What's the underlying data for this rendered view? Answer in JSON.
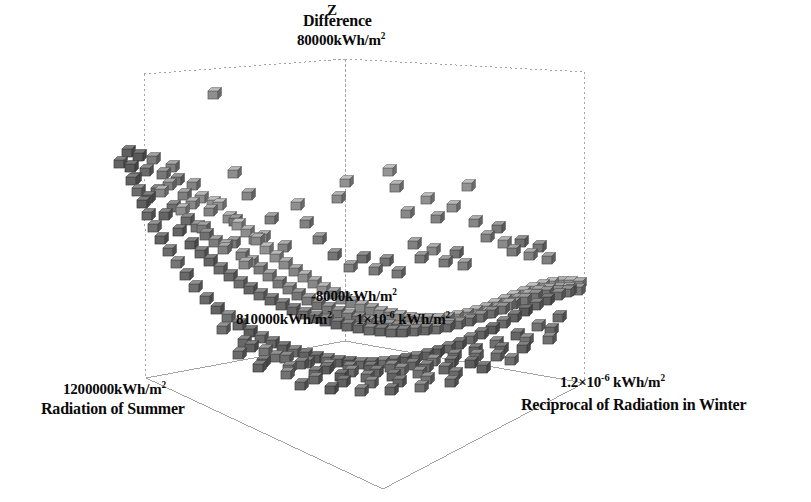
{
  "figure": {
    "type": "3d-scatter-plot",
    "background": "#ffffff",
    "frame_color": "#8a8a8a",
    "text_color": "#0a0a0a"
  },
  "labels": {
    "z_axis_letter": "Z",
    "z_title": "Difference",
    "z_max_tick": "80000kWh/m",
    "z_max_tick_exp": "2",
    "z_origin_tick": "-8000kWh/m",
    "z_origin_tick_exp": "2",
    "x_origin_tick": "810000kWh/m",
    "x_origin_tick_exp": "2",
    "y_origin_tick_prefix": "1×10",
    "y_origin_tick_exp": "-6",
    "y_origin_tick_suffix": " kWh/m",
    "y_origin_tick_unit_exp": "2",
    "x_max_tick": "1200000kWh/m",
    "x_max_tick_exp": "2",
    "x_axis_name": "Radiation of Summer",
    "y_max_tick_prefix": "1.2×10",
    "y_max_tick_exp": "-6",
    "y_max_tick_suffix": " kWh/m",
    "y_max_tick_unit_exp": "2",
    "y_axis_name": "Reciprocal of Radiation in Winter"
  },
  "chart_data": {
    "type": "scatter",
    "title": "Difference",
    "xlabel": "Radiation of Summer",
    "ylabel": "Reciprocal of Radiation in Winter",
    "zlabel": "Difference",
    "xlim": [
      "810000kWh/m2",
      "1200000kWh/m2"
    ],
    "ylim": [
      "1×10-6 kWh/m2",
      "1.2×10-6 kWh/m2"
    ],
    "zlim": [
      "-8000kWh/m2",
      "80000kWh/m2"
    ],
    "grid": false,
    "legend": false,
    "marker": "cube",
    "marker_size_px": 10,
    "marker_colors": [
      "#4a4a4a",
      "#5e5e5e",
      "#707070",
      "#858585",
      "#9a9a9a",
      "#aeaeae",
      "#bcbcbc"
    ],
    "points_px": [
      [
        213,
        95,
        0.72
      ],
      [
        127,
        153,
        0.3
      ],
      [
        138,
        157,
        0.26
      ],
      [
        119,
        164,
        0.34
      ],
      [
        152,
        160,
        0.55
      ],
      [
        145,
        172,
        0.4
      ],
      [
        162,
        175,
        0.52
      ],
      [
        131,
        181,
        0.33
      ],
      [
        168,
        186,
        0.62
      ],
      [
        176,
        181,
        0.48
      ],
      [
        156,
        192,
        0.38
      ],
      [
        183,
        196,
        0.58
      ],
      [
        147,
        199,
        0.3
      ],
      [
        191,
        205,
        0.66
      ],
      [
        200,
        199,
        0.7
      ],
      [
        172,
        208,
        0.44
      ],
      [
        164,
        216,
        0.36
      ],
      [
        209,
        212,
        0.62
      ],
      [
        218,
        206,
        0.74
      ],
      [
        186,
        221,
        0.41
      ],
      [
        196,
        228,
        0.5
      ],
      [
        178,
        232,
        0.35
      ],
      [
        228,
        219,
        0.68
      ],
      [
        237,
        226,
        0.76
      ],
      [
        205,
        236,
        0.46
      ],
      [
        214,
        243,
        0.56
      ],
      [
        190,
        245,
        0.33
      ],
      [
        246,
        233,
        0.7
      ],
      [
        223,
        250,
        0.6
      ],
      [
        232,
        244,
        0.52
      ],
      [
        200,
        254,
        0.38
      ],
      [
        256,
        241,
        0.66
      ],
      [
        241,
        256,
        0.58
      ],
      [
        209,
        262,
        0.35
      ],
      [
        265,
        250,
        0.74
      ],
      [
        250,
        263,
        0.62
      ],
      [
        219,
        270,
        0.42
      ],
      [
        275,
        258,
        0.71
      ],
      [
        259,
        270,
        0.55
      ],
      [
        229,
        277,
        0.39
      ],
      [
        284,
        265,
        0.68
      ],
      [
        268,
        277,
        0.6
      ],
      [
        239,
        284,
        0.44
      ],
      [
        294,
        272,
        0.63
      ],
      [
        278,
        284,
        0.52
      ],
      [
        249,
        290,
        0.36
      ],
      [
        303,
        278,
        0.7
      ],
      [
        288,
        290,
        0.57
      ],
      [
        259,
        296,
        0.43
      ],
      [
        313,
        284,
        0.65
      ],
      [
        297,
        296,
        0.5
      ],
      [
        270,
        301,
        0.38
      ],
      [
        322,
        290,
        0.72
      ],
      [
        307,
        301,
        0.55
      ],
      [
        281,
        306,
        0.41
      ],
      [
        332,
        295,
        0.6
      ],
      [
        317,
        306,
        0.48
      ],
      [
        292,
        311,
        0.36
      ],
      [
        341,
        300,
        0.68
      ],
      [
        327,
        310,
        0.52
      ],
      [
        303,
        315,
        0.44
      ],
      [
        351,
        304,
        0.62
      ],
      [
        337,
        314,
        0.5
      ],
      [
        314,
        319,
        0.38
      ],
      [
        360,
        308,
        0.66
      ],
      [
        347,
        317,
        0.55
      ],
      [
        325,
        322,
        0.42
      ],
      [
        370,
        311,
        0.58
      ],
      [
        357,
        320,
        0.46
      ],
      [
        336,
        325,
        0.35
      ],
      [
        379,
        314,
        0.64
      ],
      [
        367,
        323,
        0.52
      ],
      [
        347,
        327,
        0.4
      ],
      [
        389,
        316,
        0.6
      ],
      [
        377,
        325,
        0.48
      ],
      [
        358,
        329,
        0.37
      ],
      [
        398,
        318,
        0.66
      ],
      [
        387,
        327,
        0.54
      ],
      [
        369,
        331,
        0.43
      ],
      [
        408,
        320,
        0.58
      ],
      [
        397,
        328,
        0.46
      ],
      [
        380,
        332,
        0.35
      ],
      [
        417,
        321,
        0.63
      ],
      [
        407,
        329,
        0.5
      ],
      [
        391,
        333,
        0.4
      ],
      [
        427,
        321,
        0.57
      ],
      [
        417,
        329,
        0.47
      ],
      [
        402,
        333,
        0.36
      ],
      [
        436,
        321,
        0.65
      ],
      [
        427,
        329,
        0.52
      ],
      [
        413,
        332,
        0.42
      ],
      [
        446,
        320,
        0.6
      ],
      [
        437,
        328,
        0.48
      ],
      [
        424,
        331,
        0.37
      ],
      [
        455,
        318,
        0.68
      ],
      [
        447,
        326,
        0.55
      ],
      [
        435,
        330,
        0.44
      ],
      [
        465,
        316,
        0.62
      ],
      [
        457,
        324,
        0.5
      ],
      [
        446,
        328,
        0.38
      ],
      [
        474,
        313,
        0.7
      ],
      [
        467,
        321,
        0.56
      ],
      [
        457,
        325,
        0.45
      ],
      [
        484,
        310,
        0.64
      ],
      [
        477,
        318,
        0.52
      ],
      [
        468,
        322,
        0.4
      ],
      [
        493,
        306,
        0.72
      ],
      [
        487,
        314,
        0.58
      ],
      [
        479,
        318,
        0.46
      ],
      [
        503,
        302,
        0.66
      ],
      [
        497,
        310,
        0.54
      ],
      [
        490,
        314,
        0.42
      ],
      [
        512,
        298,
        0.74
      ],
      [
        507,
        306,
        0.6
      ],
      [
        501,
        310,
        0.48
      ],
      [
        522,
        294,
        0.68
      ],
      [
        517,
        301,
        0.56
      ],
      [
        512,
        305,
        0.44
      ],
      [
        531,
        290,
        0.76
      ],
      [
        527,
        297,
        0.62
      ],
      [
        523,
        301,
        0.5
      ],
      [
        541,
        287,
        0.7
      ],
      [
        537,
        293,
        0.58
      ],
      [
        534,
        297,
        0.46
      ],
      [
        550,
        285,
        0.72
      ],
      [
        547,
        291,
        0.6
      ],
      [
        545,
        294,
        0.48
      ],
      [
        560,
        284,
        0.66
      ],
      [
        557,
        290,
        0.54
      ],
      [
        556,
        293,
        0.42
      ],
      [
        569,
        284,
        0.7
      ],
      [
        567,
        290,
        0.58
      ],
      [
        566,
        293,
        0.46
      ],
      [
        578,
        285,
        0.64
      ],
      [
        577,
        291,
        0.52
      ],
      [
        345,
        183,
        0.74
      ],
      [
        337,
        199,
        0.68
      ],
      [
        388,
        172,
        0.77
      ],
      [
        395,
        188,
        0.7
      ],
      [
        406,
        214,
        0.66
      ],
      [
        426,
        200,
        0.73
      ],
      [
        436,
        219,
        0.62
      ],
      [
        452,
        208,
        0.71
      ],
      [
        467,
        187,
        0.75
      ],
      [
        474,
        223,
        0.64
      ],
      [
        296,
        206,
        0.72
      ],
      [
        305,
        224,
        0.6
      ],
      [
        318,
        240,
        0.56
      ],
      [
        262,
        238,
        0.66
      ],
      [
        283,
        248,
        0.62
      ],
      [
        233,
        174,
        0.7
      ],
      [
        247,
        196,
        0.64
      ],
      [
        270,
        220,
        0.58
      ],
      [
        486,
        238,
        0.6
      ],
      [
        497,
        229,
        0.52
      ],
      [
        503,
        244,
        0.68
      ],
      [
        512,
        252,
        0.55
      ],
      [
        520,
        243,
        0.46
      ],
      [
        529,
        256,
        0.62
      ],
      [
        538,
        248,
        0.5
      ],
      [
        547,
        260,
        0.58
      ],
      [
        413,
        245,
        0.6
      ],
      [
        420,
        259,
        0.52
      ],
      [
        432,
        251,
        0.64
      ],
      [
        444,
        263,
        0.54
      ],
      [
        455,
        254,
        0.48
      ],
      [
        463,
        266,
        0.6
      ],
      [
        333,
        256,
        0.5
      ],
      [
        349,
        268,
        0.58
      ],
      [
        362,
        259,
        0.44
      ],
      [
        374,
        271,
        0.55
      ],
      [
        385,
        262,
        0.48
      ],
      [
        397,
        274,
        0.52
      ],
      [
        205,
        300,
        0.4
      ],
      [
        216,
        310,
        0.34
      ],
      [
        227,
        318,
        0.46
      ],
      [
        238,
        326,
        0.38
      ],
      [
        249,
        333,
        0.3
      ],
      [
        260,
        339,
        0.42
      ],
      [
        271,
        344,
        0.35
      ],
      [
        282,
        349,
        0.28
      ],
      [
        293,
        353,
        0.4
      ],
      [
        304,
        356,
        0.33
      ],
      [
        315,
        359,
        0.26
      ],
      [
        326,
        361,
        0.38
      ],
      [
        337,
        363,
        0.31
      ],
      [
        348,
        364,
        0.24
      ],
      [
        359,
        365,
        0.36
      ],
      [
        370,
        365,
        0.29
      ],
      [
        381,
        364,
        0.42
      ],
      [
        392,
        363,
        0.34
      ],
      [
        403,
        361,
        0.27
      ],
      [
        414,
        359,
        0.39
      ],
      [
        425,
        356,
        0.32
      ],
      [
        436,
        353,
        0.25
      ],
      [
        447,
        349,
        0.37
      ],
      [
        458,
        345,
        0.3
      ],
      [
        469,
        340,
        0.43
      ],
      [
        480,
        335,
        0.35
      ],
      [
        491,
        330,
        0.28
      ],
      [
        502,
        324,
        0.4
      ],
      [
        513,
        318,
        0.33
      ],
      [
        524,
        312,
        0.26
      ],
      [
        535,
        306,
        0.38
      ],
      [
        546,
        301,
        0.31
      ],
      [
        557,
        296,
        0.44
      ],
      [
        568,
        292,
        0.36
      ],
      [
        194,
        288,
        0.44
      ],
      [
        185,
        276,
        0.38
      ],
      [
        176,
        264,
        0.5
      ],
      [
        168,
        252,
        0.42
      ],
      [
        160,
        240,
        0.34
      ],
      [
        153,
        228,
        0.46
      ],
      [
        147,
        216,
        0.38
      ],
      [
        142,
        204,
        0.3
      ],
      [
        137,
        192,
        0.42
      ],
      [
        133,
        180,
        0.35
      ],
      [
        130,
        168,
        0.27
      ],
      [
        222,
        330,
        0.45
      ],
      [
        243,
        343,
        0.38
      ],
      [
        264,
        352,
        0.5
      ],
      [
        285,
        359,
        0.42
      ],
      [
        306,
        364,
        0.34
      ],
      [
        327,
        367,
        0.46
      ],
      [
        348,
        369,
        0.38
      ],
      [
        369,
        369,
        0.3
      ],
      [
        390,
        368,
        0.42
      ],
      [
        411,
        366,
        0.35
      ],
      [
        432,
        362,
        0.48
      ],
      [
        453,
        357,
        0.4
      ],
      [
        474,
        351,
        0.32
      ],
      [
        495,
        344,
        0.44
      ],
      [
        516,
        336,
        0.36
      ],
      [
        537,
        327,
        0.48
      ],
      [
        558,
        318,
        0.4
      ],
      [
        250,
        348,
        0.33
      ],
      [
        275,
        358,
        0.45
      ],
      [
        300,
        365,
        0.37
      ],
      [
        325,
        370,
        0.29
      ],
      [
        350,
        373,
        0.41
      ],
      [
        375,
        373,
        0.34
      ],
      [
        400,
        371,
        0.46
      ],
      [
        425,
        368,
        0.38
      ],
      [
        450,
        363,
        0.3
      ],
      [
        475,
        357,
        0.42
      ],
      [
        500,
        350,
        0.35
      ],
      [
        525,
        341,
        0.47
      ],
      [
        550,
        331,
        0.39
      ],
      [
        238,
        355,
        0.4
      ],
      [
        262,
        363,
        0.32
      ],
      [
        288,
        369,
        0.44
      ],
      [
        314,
        374,
        0.36
      ],
      [
        340,
        377,
        0.28
      ],
      [
        366,
        378,
        0.4
      ],
      [
        392,
        377,
        0.33
      ],
      [
        418,
        374,
        0.45
      ],
      [
        444,
        370,
        0.37
      ],
      [
        470,
        364,
        0.29
      ],
      [
        496,
        357,
        0.41
      ],
      [
        522,
        349,
        0.34
      ],
      [
        548,
        340,
        0.46
      ],
      [
        258,
        368,
        0.35
      ],
      [
        286,
        375,
        0.47
      ],
      [
        314,
        380,
        0.39
      ],
      [
        342,
        383,
        0.31
      ],
      [
        370,
        384,
        0.43
      ],
      [
        398,
        383,
        0.36
      ],
      [
        426,
        380,
        0.48
      ],
      [
        454,
        375,
        0.4
      ],
      [
        482,
        369,
        0.32
      ],
      [
        510,
        361,
        0.44
      ],
      [
        300,
        386,
        0.37
      ],
      [
        330,
        390,
        0.29
      ],
      [
        360,
        392,
        0.41
      ],
      [
        390,
        391,
        0.34
      ],
      [
        420,
        388,
        0.46
      ],
      [
        450,
        383,
        0.38
      ],
      [
        160,
        193,
        0.66
      ],
      [
        171,
        168,
        0.58
      ],
      [
        181,
        211,
        0.7
      ],
      [
        192,
        186,
        0.62
      ],
      [
        202,
        229,
        0.54
      ],
      [
        212,
        204,
        0.74
      ],
      [
        224,
        247,
        0.58
      ],
      [
        234,
        222,
        0.5
      ],
      [
        244,
        265,
        0.66
      ],
      [
        254,
        240,
        0.62
      ]
    ]
  }
}
